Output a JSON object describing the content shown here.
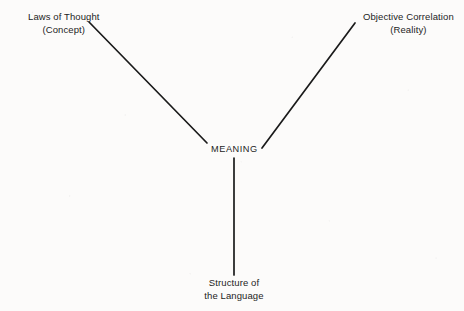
{
  "diagram": {
    "type": "tripartite-meaning-diagram",
    "background_color": "#fcfbfa",
    "line_color": "#1a1a1a",
    "text_color": "#1d1d1d",
    "nodes": {
      "concept": {
        "line1": "Laws of Thought",
        "line2": "(Concept)",
        "position": "top-left"
      },
      "reality": {
        "line1": "Objective Correlation",
        "line2": "(Reality)",
        "position": "top-right"
      },
      "meaning": {
        "label": "MEANING",
        "position": "center"
      },
      "structure": {
        "line1": "Structure of",
        "line2": "the Language",
        "position": "bottom-center"
      }
    },
    "edges": [
      {
        "name": "concept-to-meaning",
        "from": "concept",
        "to": "meaning",
        "x1": 89,
        "y1": 22,
        "x2": 207,
        "y2": 143
      },
      {
        "name": "reality-to-meaning",
        "from": "reality",
        "to": "meaning",
        "x1": 355,
        "y1": 23,
        "x2": 262,
        "y2": 148
      },
      {
        "name": "meaning-to-structure",
        "from": "meaning",
        "to": "structure",
        "x1": 234,
        "y1": 158,
        "x2": 234,
        "y2": 275
      }
    ]
  }
}
